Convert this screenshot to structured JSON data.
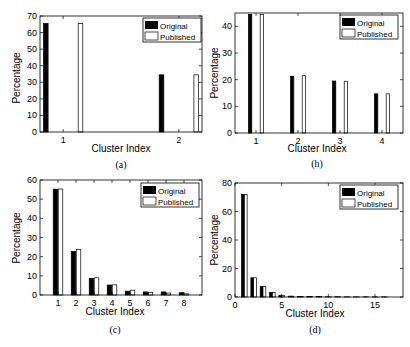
{
  "chart_data": [
    {
      "id": "a",
      "type": "bar",
      "caption": "(a)",
      "xlabel": "Cluster Index",
      "ylabel": "Percentage",
      "categories": [
        "1",
        "2"
      ],
      "x": [
        1,
        2
      ],
      "xlim": [
        0.8,
        2.2
      ],
      "ylim": [
        0,
        70
      ],
      "yticks": [
        0,
        10,
        20,
        30,
        40,
        50,
        60,
        70
      ],
      "xticks": [
        1,
        2
      ],
      "bar_offsets": [
        -0.15,
        0.15
      ],
      "bar_width": 0.04,
      "legend": [
        "Original",
        "Published"
      ],
      "legend_position": "upper right",
      "series": [
        {
          "name": "Original",
          "values": [
            65.5,
            34.5
          ],
          "color": "#000000"
        },
        {
          "name": "Published",
          "values": [
            65.5,
            34.5
          ],
          "color": "#ffffff"
        }
      ]
    },
    {
      "id": "b",
      "type": "bar",
      "caption": "(b)",
      "xlabel": "Cluster Index",
      "ylabel": "Percentage",
      "categories": [
        "1",
        "2",
        "3",
        "4"
      ],
      "x": [
        1,
        2,
        3,
        4
      ],
      "xlim": [
        0.5,
        4.5
      ],
      "ylim": [
        0,
        45
      ],
      "yticks": [
        0,
        10,
        20,
        30,
        40
      ],
      "xticks": [
        1,
        2,
        3,
        4
      ],
      "bar_offsets": [
        -0.14,
        0.14
      ],
      "bar_width": 0.08,
      "legend": [
        "Original",
        "Published"
      ],
      "legend_position": "upper right",
      "series": [
        {
          "name": "Original",
          "values": [
            44.5,
            21.3,
            19.5,
            14.7
          ],
          "color": "#000000"
        },
        {
          "name": "Published",
          "values": [
            44.5,
            21.5,
            19.4,
            14.7
          ],
          "color": "#ffffff"
        }
      ]
    },
    {
      "id": "c",
      "type": "bar",
      "caption": "(c)",
      "xlabel": "Cluster Index",
      "ylabel": "Percentage",
      "categories": [
        "1",
        "2",
        "3",
        "4",
        "5",
        "6",
        "7",
        "8"
      ],
      "x": [
        1,
        2,
        3,
        4,
        5,
        6,
        7,
        8
      ],
      "xlim": [
        0,
        9
      ],
      "ylim": [
        0,
        60
      ],
      "yticks": [
        0,
        10,
        20,
        30,
        40,
        50,
        60
      ],
      "xticks": [
        1,
        2,
        3,
        4,
        5,
        6,
        7,
        8
      ],
      "bar_offsets": [
        -0.14,
        0.14
      ],
      "bar_width": 0.25,
      "legend": [
        "Original",
        "Published"
      ],
      "legend_position": "upper right",
      "series": [
        {
          "name": "Original",
          "values": [
            55.2,
            22.8,
            8.7,
            5.2,
            2.0,
            1.6,
            1.6,
            1.2
          ],
          "color": "#000000"
        },
        {
          "name": "Published",
          "values": [
            55.3,
            23.7,
            9.0,
            5.3,
            2.5,
            1.4,
            1.0,
            0.6
          ],
          "color": "#ffffff"
        }
      ]
    },
    {
      "id": "d",
      "type": "bar",
      "caption": "(d)",
      "xlabel": "Cluster Index",
      "ylabel": "Percentage",
      "categories": [
        "1",
        "2",
        "3",
        "4",
        "5",
        "6",
        "7",
        "8",
        "9",
        "10",
        "11",
        "12",
        "13",
        "14",
        "15",
        "16"
      ],
      "x": [
        1,
        2,
        3,
        4,
        5,
        6,
        7,
        8,
        9,
        10,
        11,
        12,
        13,
        14,
        15,
        16
      ],
      "xlim": [
        0,
        18
      ],
      "ylim": [
        0,
        80
      ],
      "yticks": [
        0,
        20,
        40,
        60,
        80
      ],
      "xticks": [
        0,
        5,
        10,
        15
      ],
      "bar_offsets": [
        -0.15,
        0.15
      ],
      "bar_width": 0.3,
      "legend": [
        "Original",
        "Published"
      ],
      "legend_position": "upper right",
      "series": [
        {
          "name": "Original",
          "values": [
            72,
            13.5,
            7.5,
            3.2,
            1.2,
            0.6,
            0.4,
            0.3,
            0.3,
            0.2,
            0.2,
            0.1,
            0.1,
            0.1,
            0.1,
            0.1
          ],
          "color": "#000000"
        },
        {
          "name": "Published",
          "values": [
            72,
            13.5,
            7.5,
            3.2,
            1.2,
            0.6,
            0.4,
            0.3,
            0.3,
            0.2,
            0.2,
            0.1,
            0.1,
            0.1,
            0.1,
            0.1
          ],
          "color": "#ffffff"
        }
      ]
    }
  ],
  "panels": {
    "a": {
      "caption": "(a)",
      "xlabel": "Cluster Index",
      "ylabel": "Percentage",
      "legend_original": "Original",
      "legend_published": "Published"
    },
    "b": {
      "caption": "(h)",
      "xlabel": "Cluster Index",
      "ylabel": "Percentage",
      "legend_original": "Original",
      "legend_published": "Published"
    },
    "c": {
      "caption": "(c)",
      "xlabel": "Cluster Index",
      "ylabel": "Percentage",
      "legend_original": "Original",
      "legend_published": "Published"
    },
    "d": {
      "caption": "(d)",
      "xlabel": "Cluster Index",
      "ylabel": "Percentage",
      "legend_original": "Original",
      "legend_published": "Published"
    }
  }
}
